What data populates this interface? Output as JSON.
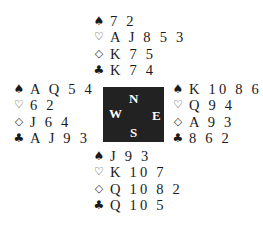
{
  "suits": {
    "spades": "♠",
    "hearts": "♡",
    "diamonds": "◇",
    "clubs": "♣"
  },
  "compass": {
    "north": "N",
    "west": "W",
    "east": "E",
    "south": "S",
    "background_color": "#222222"
  },
  "hands": {
    "north": {
      "spades": "7 2",
      "hearts": "A J 8 5 3",
      "diamonds": "K 7 5",
      "clubs": "K 7 4"
    },
    "west": {
      "spades": "A Q 5 4",
      "hearts": "6 2",
      "diamonds": "J 6 4",
      "clubs": "A J 9 3"
    },
    "east": {
      "spades": "K 10 8 6",
      "hearts": "Q 9 4",
      "diamonds": "A 9 3",
      "clubs": "8 6 2"
    },
    "south": {
      "spades": "J 9 3",
      "hearts": "K 10 7",
      "diamonds": "Q 10 8 2",
      "clubs": "Q 10 5"
    }
  }
}
